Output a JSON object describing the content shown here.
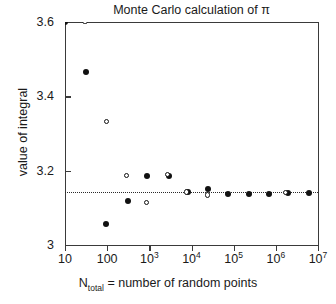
{
  "chart_data": {
    "type": "scatter",
    "title": "Monte Carlo calculation of π",
    "xlabel": "N_total = number of random points",
    "xlabel_main": "N",
    "xlabel_sub": "total",
    "xlabel_rest": " = number of random points",
    "ylabel": "value of integral",
    "xscale": "log",
    "yscale": "linear",
    "xlim": [
      10,
      10000000
    ],
    "ylim": [
      3.0,
      3.6
    ],
    "grid": false,
    "legend": null,
    "xticks": [
      {
        "value": 10,
        "label": "10",
        "mantissa": "10",
        "exponent": ""
      },
      {
        "value": 100,
        "label": "100",
        "mantissa": "100",
        "exponent": ""
      },
      {
        "value": 1000,
        "label": "10^3",
        "mantissa": "10",
        "exponent": "3"
      },
      {
        "value": 10000,
        "label": "10^4",
        "mantissa": "10",
        "exponent": "4"
      },
      {
        "value": 100000,
        "label": "10^5",
        "mantissa": "10",
        "exponent": "5"
      },
      {
        "value": 1000000,
        "label": "10^6",
        "mantissa": "10",
        "exponent": "6"
      },
      {
        "value": 10000000,
        "label": "10^7",
        "mantissa": "10",
        "exponent": "7"
      }
    ],
    "yticks": [
      {
        "value": 3.0,
        "label": "3"
      },
      {
        "value": 3.2,
        "label": "3.2"
      },
      {
        "value": 3.4,
        "label": "3.4"
      },
      {
        "value": 3.6,
        "label": "3.6"
      }
    ],
    "reference_line": {
      "value": 3.1416,
      "label": "π",
      "style": "dotted"
    },
    "series": [
      {
        "name": "run-1",
        "marker": "filled-circle",
        "color": "#111111",
        "points": [
          {
            "x": 10,
            "y": 3.6
          },
          {
            "x": 32,
            "y": 3.465
          },
          {
            "x": 96,
            "y": 3.057
          },
          {
            "x": 310,
            "y": 3.118
          },
          {
            "x": 900,
            "y": 3.185
          },
          {
            "x": 2900,
            "y": 3.186
          },
          {
            "x": 8200,
            "y": 3.142
          },
          {
            "x": 24000,
            "y": 3.152
          },
          {
            "x": 75000,
            "y": 3.137
          },
          {
            "x": 230000,
            "y": 3.136
          },
          {
            "x": 680000,
            "y": 3.138
          },
          {
            "x": 1900000,
            "y": 3.139
          },
          {
            "x": 6200000,
            "y": 3.139
          }
        ]
      },
      {
        "name": "run-2",
        "marker": "open-circle",
        "color": "#111111",
        "points": [
          {
            "x": 31,
            "y": 3.6
          },
          {
            "x": 100,
            "y": 3.33
          },
          {
            "x": 300,
            "y": 3.186
          },
          {
            "x": 880,
            "y": 3.113
          },
          {
            "x": 2800,
            "y": 3.188
          },
          {
            "x": 8000,
            "y": 3.141
          },
          {
            "x": 24500,
            "y": 3.133
          },
          {
            "x": 1750000,
            "y": 3.139
          }
        ]
      }
    ]
  }
}
